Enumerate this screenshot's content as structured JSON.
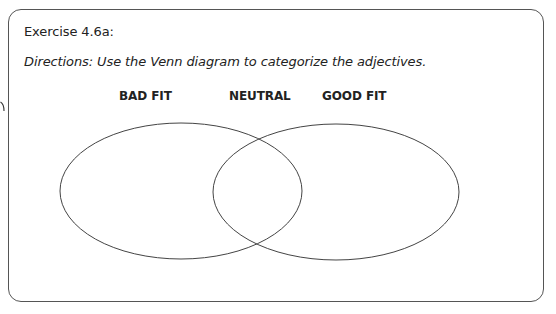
{
  "exercise": {
    "title": "Exercise 4.6a:",
    "directions": "Directions: Use the Venn diagram to categorize the adjectives."
  },
  "venn": {
    "labels": [
      {
        "id": "bad-fit",
        "text": "BAD FIT"
      },
      {
        "id": "neutral",
        "text": "NEUTRAL"
      },
      {
        "id": "good-fit",
        "text": "GOOD FIT"
      }
    ],
    "circles": [
      {
        "name": "bad-fit-circle",
        "cx": 181,
        "cy": 191,
        "rx": 121,
        "ry": 68
      },
      {
        "name": "good-fit-circle",
        "cx": 336,
        "cy": 192,
        "rx": 123,
        "ry": 68
      }
    ],
    "stroke_color": "#444444"
  },
  "frame": {
    "border_color": "#555555"
  }
}
